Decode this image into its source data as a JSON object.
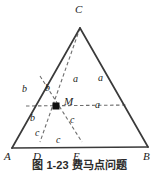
{
  "figure": {
    "colors": {
      "solid_stroke": "#3a3a3a",
      "dashed_stroke": "#6e6e6e",
      "point_marker": "#111111",
      "label_text": "#1c1c1c",
      "background": "#ffffff"
    },
    "vertices": [
      {
        "id": "vertex-c",
        "label": "C",
        "x": 80,
        "y": 28,
        "label_x": 75,
        "label_y": 4
      },
      {
        "id": "vertex-a",
        "label": "A",
        "x": 12,
        "y": 148,
        "label_x": 4,
        "label_y": 151
      },
      {
        "id": "vertex-b",
        "label": "B",
        "x": 148,
        "y": 147,
        "label_x": 143,
        "label_y": 151
      },
      {
        "id": "point-d",
        "label": "D",
        "x": 38,
        "y": 148,
        "label_x": 33,
        "label_y": 151
      },
      {
        "id": "point-e",
        "label": "E",
        "x": 78,
        "y": 148,
        "label_x": 73,
        "label_y": 151
      },
      {
        "id": "point-m",
        "label": "M",
        "x": 56,
        "y": 106,
        "label_x": 64,
        "label_y": 96
      }
    ],
    "segment_labels": [
      {
        "id": "label-a-1",
        "text": "a",
        "x": 73,
        "y": 74
      },
      {
        "id": "label-a-2",
        "text": "a",
        "x": 98,
        "y": 73
      },
      {
        "id": "label-a-3",
        "text": "a",
        "x": 95,
        "y": 100
      },
      {
        "id": "label-b-1",
        "text": "b",
        "x": 22,
        "y": 84
      },
      {
        "id": "label-b-2",
        "text": "b",
        "x": 45,
        "y": 83
      },
      {
        "id": "label-b-3",
        "text": "b",
        "x": 30,
        "y": 113
      },
      {
        "id": "label-c-1",
        "text": "c",
        "x": 35,
        "y": 128
      },
      {
        "id": "label-c-2",
        "text": "c",
        "x": 70,
        "y": 115
      },
      {
        "id": "label-c-3",
        "text": "c",
        "x": 56,
        "y": 135
      }
    ],
    "solid_edges": [
      {
        "id": "edge-ca",
        "x1": 80,
        "y1": 28,
        "x2": 12,
        "y2": 148
      },
      {
        "id": "edge-cb",
        "x1": 80,
        "y1": 28,
        "x2": 148,
        "y2": 147
      },
      {
        "id": "edge-ab",
        "x1": 12,
        "y1": 148,
        "x2": 148,
        "y2": 147
      }
    ],
    "dashed_lines": [
      {
        "id": "cevian-c-to-base",
        "x1": 80,
        "y1": 28,
        "x2": 40,
        "y2": 142
      },
      {
        "id": "cevian-a-side-to-e",
        "x1": 40,
        "y1": 76,
        "x2": 82,
        "y2": 142
      },
      {
        "id": "cevian-through-m-left",
        "x1": 26,
        "y1": 106,
        "x2": 128,
        "y2": 105
      }
    ],
    "caption": "图 1-23   费马点问题"
  }
}
